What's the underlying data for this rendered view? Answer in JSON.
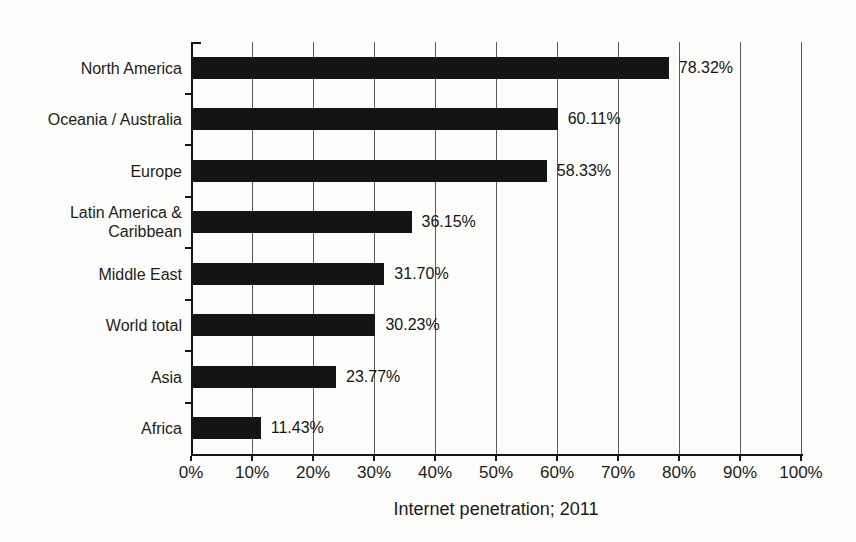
{
  "chart_data": {
    "type": "bar",
    "orientation": "horizontal",
    "title": "",
    "xlabel": "Internet penetration; 2011",
    "ylabel": "",
    "xlim": [
      0,
      100
    ],
    "grid": true,
    "legend": false,
    "bar_color": "#141414",
    "categories": [
      "North America",
      "Oceania / Australia",
      "Europe",
      "Latin America & Caribbean",
      "Middle East",
      "World total",
      "Asia",
      "Africa"
    ],
    "values": [
      78.32,
      60.11,
      58.33,
      36.15,
      31.7,
      30.23,
      23.77,
      11.43
    ],
    "value_labels": [
      "78.32%",
      "60.11%",
      "58.33%",
      "36.15%",
      "31.70%",
      "30.23%",
      "23.77%",
      "11.43%"
    ],
    "x_tick_labels": [
      "0%",
      "10%",
      "20%",
      "30%",
      "40%",
      "50%",
      "60%",
      "70%",
      "80%",
      "90%",
      "100%"
    ]
  }
}
